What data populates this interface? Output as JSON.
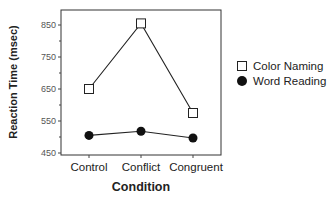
{
  "chart_data": {
    "type": "line",
    "title": "",
    "xlabel": "Condition",
    "ylabel": "Reaction Time (msec)",
    "categories": [
      "Control",
      "Conflict",
      "Congruent"
    ],
    "ylim": [
      450,
      900
    ],
    "yticks": [
      450,
      550,
      650,
      750,
      850
    ],
    "grid": false,
    "legend_position": "right",
    "series": [
      {
        "name": "Color Naming",
        "marker": "open-square",
        "values": [
          650,
          855,
          575
        ]
      },
      {
        "name": "Word Reading",
        "marker": "filled-circle",
        "values": [
          505,
          518,
          497
        ]
      }
    ]
  },
  "legend": {
    "items": [
      {
        "label": "Color Naming"
      },
      {
        "label": "Word Reading"
      }
    ]
  }
}
